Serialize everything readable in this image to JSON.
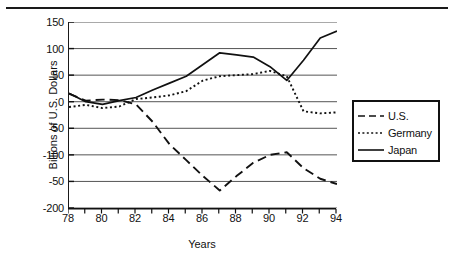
{
  "figure": {
    "top_rule": true
  },
  "chart_data": {
    "type": "line",
    "title": "",
    "xlabel": "Years",
    "ylabel": "Billions of U.S. Dollars",
    "x": [
      78,
      79,
      80,
      81,
      82,
      83,
      84,
      85,
      86,
      87,
      88,
      89,
      90,
      91,
      92,
      93,
      94
    ],
    "xlim": [
      78,
      94
    ],
    "ylim": [
      -200,
      150
    ],
    "xtick_labels": [
      "78",
      "80",
      "82",
      "84",
      "86",
      "88",
      "90",
      "92",
      "94"
    ],
    "xtick_values": [
      78,
      80,
      82,
      84,
      86,
      88,
      90,
      92,
      94
    ],
    "xtick_minor_values": [
      79,
      81,
      83,
      85,
      87,
      89,
      91,
      93
    ],
    "ytick_labels": [
      "150",
      "100",
      "50",
      "0",
      "-50",
      "-100",
      "-50",
      "-200"
    ],
    "ytick_values": [
      150,
      100,
      50,
      0,
      -50,
      -100,
      -150,
      -200
    ],
    "grid": "horizontal",
    "legend_position": "right",
    "series": [
      {
        "name": "U.S.",
        "style": "dashed",
        "color": "#111111",
        "values": [
          15,
          2,
          4,
          3,
          -5,
          -38,
          -80,
          -110,
          -140,
          -167,
          -140,
          -115,
          -100,
          -95,
          -125,
          -145,
          -155
        ]
      },
      {
        "name": "Germany",
        "style": "dotted",
        "color": "#111111",
        "values": [
          -10,
          -6,
          -12,
          -9,
          5,
          8,
          12,
          20,
          40,
          48,
          50,
          52,
          58,
          48,
          -18,
          -22,
          -20
        ]
      },
      {
        "name": "Japan",
        "style": "solid",
        "color": "#111111",
        "values": [
          16,
          0,
          -5,
          2,
          8,
          22,
          35,
          48,
          70,
          92,
          88,
          84,
          66,
          40,
          78,
          120,
          133
        ]
      }
    ]
  },
  "legend": {
    "items": [
      {
        "label": "U.S.",
        "style": "dashed"
      },
      {
        "label": "Germany",
        "style": "dotted"
      },
      {
        "label": "Japan",
        "style": "solid"
      }
    ]
  }
}
